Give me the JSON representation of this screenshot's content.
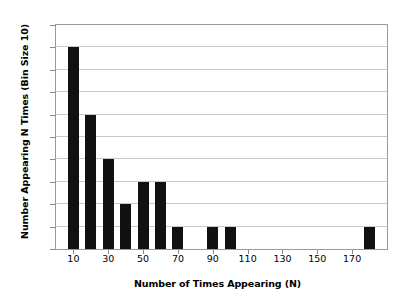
{
  "chart_data": {
    "type": "bar",
    "title": "",
    "xlabel": "Number of Times Appearing (N)",
    "ylabel": "Number Appearing N Times (Bin Size 10)",
    "x": [
      10,
      20,
      30,
      40,
      50,
      60,
      70,
      80,
      90,
      100,
      110,
      120,
      130,
      140,
      150,
      160,
      170,
      180
    ],
    "values": [
      9,
      6,
      4,
      2,
      3,
      3,
      1,
      0,
      1,
      1,
      0,
      0,
      0,
      0,
      0,
      0,
      0,
      1
    ],
    "categories": [
      "10",
      "20",
      "30",
      "40",
      "50",
      "60",
      "70",
      "80",
      "90",
      "100",
      "110",
      "120",
      "130",
      "140",
      "150",
      "160",
      "170",
      "180"
    ],
    "xlim": [
      0,
      190
    ],
    "ylim": [
      0,
      10
    ],
    "xticks": [
      10,
      30,
      50,
      70,
      90,
      110,
      130,
      150,
      170
    ],
    "xtick_labels": [
      "10",
      "30",
      "50",
      "70",
      "90",
      "110",
      "130",
      "150",
      "170"
    ],
    "yticks": [
      0,
      1,
      2,
      3,
      4,
      5,
      6,
      7,
      8,
      9,
      10
    ],
    "ytick_labels": [
      "0",
      "1",
      "2",
      "3",
      "4",
      "5",
      "6",
      "7",
      "8",
      "9",
      "10"
    ],
    "grid": true,
    "grid_axis": "y",
    "legend": null,
    "bar_color": "#111111",
    "grid_color": "#c8c8c8",
    "frame_color": "#9a9a9a",
    "bin_size": 10
  }
}
